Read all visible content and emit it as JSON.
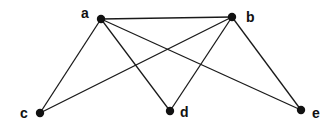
{
  "diagram": {
    "type": "graph",
    "directed": false,
    "nodes": [
      {
        "id": "a",
        "label": "a",
        "x": 101,
        "y": 19,
        "lx": 81,
        "ly": 18
      },
      {
        "id": "b",
        "label": "b",
        "x": 232,
        "y": 17,
        "lx": 246,
        "ly": 22
      },
      {
        "id": "c",
        "label": "c",
        "x": 40,
        "y": 113,
        "lx": 20,
        "ly": 118
      },
      {
        "id": "d",
        "label": "d",
        "x": 170,
        "y": 111,
        "lx": 180,
        "ly": 117
      },
      {
        "id": "e",
        "label": "e",
        "x": 301,
        "y": 110,
        "lx": 312,
        "ly": 118
      }
    ],
    "edges": [
      {
        "from": "a",
        "to": "b"
      },
      {
        "from": "a",
        "to": "c"
      },
      {
        "from": "a",
        "to": "d"
      },
      {
        "from": "a",
        "to": "e"
      },
      {
        "from": "b",
        "to": "c"
      },
      {
        "from": "b",
        "to": "d"
      },
      {
        "from": "b",
        "to": "e"
      }
    ]
  },
  "labels": {
    "a": "a",
    "b": "b",
    "c": "c",
    "d": "d",
    "e": "e"
  }
}
